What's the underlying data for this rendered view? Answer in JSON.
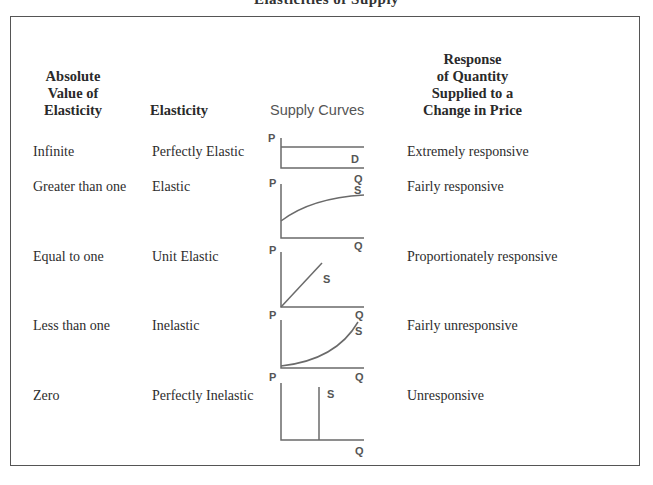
{
  "title": "Elasticities of Supply",
  "headers": {
    "absolute_value": [
      "Absolute",
      "Value of",
      "Elasticity"
    ],
    "elasticity": "Elasticity",
    "supply_curves": "Supply Curves",
    "response": [
      "Response",
      "of Quantity",
      "Supplied to a",
      "Change in Price"
    ]
  },
  "rows": [
    {
      "absolute_value": "Infinite",
      "elasticity": "Perfectly Elastic",
      "curve_type": "horizontal",
      "curve_label": "D",
      "response": "Extremely responsive"
    },
    {
      "absolute_value": "Greater than one",
      "elasticity": "Elastic",
      "curve_type": "concave",
      "curve_label": "S",
      "response": "Fairly responsive"
    },
    {
      "absolute_value": "Equal to one",
      "elasticity": "Unit Elastic",
      "curve_type": "linear-origin",
      "curve_label": "S",
      "response": "Proportionately responsive"
    },
    {
      "absolute_value": "Less than one",
      "elasticity": "Inelastic",
      "curve_type": "convex",
      "curve_label": "S",
      "response": "Fairly unresponsive"
    },
    {
      "absolute_value": "Zero",
      "elasticity": "Perfectly Inelastic",
      "curve_type": "vertical",
      "curve_label": "S",
      "response": "Unresponsive"
    }
  ],
  "axes": {
    "y": "P",
    "x": "Q"
  }
}
